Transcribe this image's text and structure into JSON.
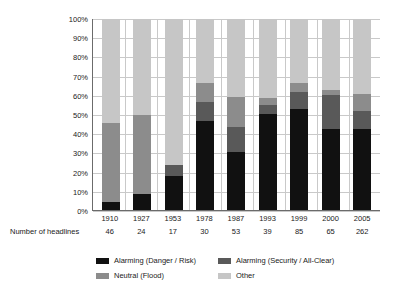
{
  "chart_data": {
    "type": "bar",
    "stacked": true,
    "normalized_percent": true,
    "title": "",
    "subtitle": "",
    "xlabel": "",
    "ylabel": "",
    "ylim": [
      0,
      100
    ],
    "yticks": [
      "0%",
      "10%",
      "20%",
      "30%",
      "40%",
      "50%",
      "60%",
      "70%",
      "80%",
      "90%",
      "100%"
    ],
    "grid": true,
    "legend_position": "bottom",
    "categories": [
      "1910",
      "1927",
      "1953",
      "1978",
      "1987",
      "1993",
      "1999",
      "2000",
      "2005"
    ],
    "series": [
      {
        "name": "Alarming (Danger / Risk)",
        "color": "#111111",
        "values": [
          4.3,
          8.3,
          17.6,
          46.7,
          30.2,
          50.5,
          52.9,
          42.5,
          42.4
        ]
      },
      {
        "name": "Alarming (Security / All-Clear)",
        "color": "#595959",
        "values": [
          0,
          0,
          6.0,
          10.0,
          13.3,
          4.5,
          9.0,
          17.5,
          9.5
        ]
      },
      {
        "name": "Neutral (Flood)",
        "color": "#8c8c8c",
        "values": [
          41.3,
          41.7,
          0,
          9.8,
          15.6,
          3.5,
          4.6,
          3.0,
          9.1
        ]
      },
      {
        "name": "Other",
        "color": "#c6c6c6",
        "values": [
          54.4,
          50.0,
          76.4,
          33.5,
          40.9,
          41.5,
          33.5,
          37.0,
          39.0
        ]
      }
    ],
    "annotations": {
      "row_label": "Number of headlines",
      "row_values": [
        "46",
        "24",
        "17",
        "30",
        "53",
        "39",
        "85",
        "65",
        "262"
      ]
    }
  },
  "axis": {
    "y_ticks": [
      "100%",
      "90%",
      "80%",
      "70%",
      "60%",
      "50%",
      "40%",
      "30%",
      "20%",
      "10%",
      "0%"
    ],
    "x_categories": [
      "1910",
      "1927",
      "1953",
      "1978",
      "1987",
      "1993",
      "1999",
      "2000",
      "2005"
    ]
  },
  "headline_counts": {
    "label": "Number of headlines",
    "values": [
      "46",
      "24",
      "17",
      "30",
      "53",
      "39",
      "85",
      "65",
      "262"
    ]
  },
  "legend": {
    "items": [
      {
        "label": "Alarming (Danger / Risk)",
        "color": "#111111"
      },
      {
        "label": "Alarming (Security / All-Clear)",
        "color": "#595959"
      },
      {
        "label": "Neutral (Flood)",
        "color": "#8c8c8c"
      },
      {
        "label": "Other",
        "color": "#c6c6c6"
      }
    ]
  }
}
